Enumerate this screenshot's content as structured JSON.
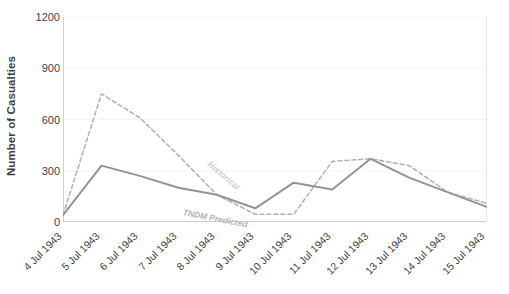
{
  "chart_data": {
    "type": "line",
    "title": "",
    "xlabel": "",
    "ylabel": "Number of Casualties",
    "ylim": [
      0,
      1200
    ],
    "yticks": [
      0,
      300,
      600,
      900,
      1200
    ],
    "grid": true,
    "legend_position": "inline-annotations",
    "categories": [
      "4 Jul 1943",
      "5 Jul 1943",
      "6 Jul 1943",
      "7 Jul 1943",
      "8 Jul 1943",
      "9 Jul 1943",
      "10 Jul 1943",
      "11 Jul 1943",
      "12 Jul 1943",
      "13 Jul 1943",
      "14 Jul 1943",
      "15 Jul 1943"
    ],
    "series": [
      {
        "name": "Historical",
        "style": "dashed",
        "color": "#b3b3b3",
        "values": [
          40,
          750,
          610,
          390,
          160,
          45,
          45,
          355,
          370,
          330,
          175,
          110
        ]
      },
      {
        "name": "TNDM Predicted",
        "style": "solid",
        "color": "#949494",
        "values": [
          40,
          330,
          270,
          200,
          160,
          80,
          230,
          190,
          370,
          260,
          175,
          90
        ]
      }
    ]
  },
  "axis": {
    "y_title": "Number of Casualties",
    "y_tick_labels": [
      "1200",
      "900",
      "600",
      "300",
      "0"
    ]
  },
  "annotations": {
    "historical": "Historical",
    "tndm_predicted": "TNDM Predicted"
  },
  "colors": {
    "historical": "#b3b3b3",
    "predicted": "#949494",
    "axis": "#cfcfcf",
    "grid": "#f2f2f2",
    "text": "#3f3f3f",
    "background": "#ffffff"
  }
}
